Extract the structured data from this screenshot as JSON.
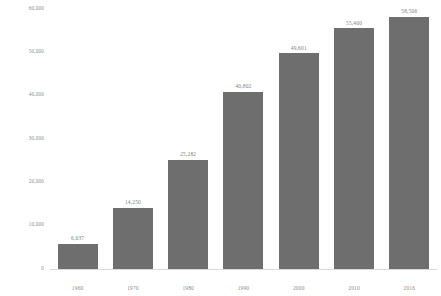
{
  "chart_data": {
    "type": "bar",
    "title": "",
    "subtitle": "",
    "xlabel": "",
    "ylabel": "",
    "categories": [
      "1960",
      "1970",
      "1980",
      "1990",
      "2000",
      "2010",
      "2016"
    ],
    "values": [
      6037,
      14250,
      25282,
      40802,
      49601,
      55400,
      58506
    ],
    "data_labels": [
      "6,037",
      "14,250",
      "25,282",
      "40,802",
      "49,601",
      "55,400",
      "58,506"
    ],
    "ylim": [
      0,
      60000
    ],
    "y_ticks": [
      0,
      10000,
      20000,
      30000,
      40000,
      50000,
      60000
    ],
    "y_tick_labels": [
      "0",
      "10,000",
      "20,000",
      "30,000",
      "40,000",
      "50,000",
      "60,000"
    ],
    "grid": false,
    "legend": null,
    "series": [
      {
        "name": "",
        "values": [
          6037,
          14250,
          25282,
          40802,
          49601,
          55400,
          58506
        ],
        "color": "#6e6e6e"
      }
    ],
    "colors": {
      "bar_fill": "#6e6e6e",
      "axis_line": "#d8d8d8",
      "tick_text": "#8a8a8a",
      "label_text": "#7d7d7d",
      "background": "#ffffff"
    }
  }
}
